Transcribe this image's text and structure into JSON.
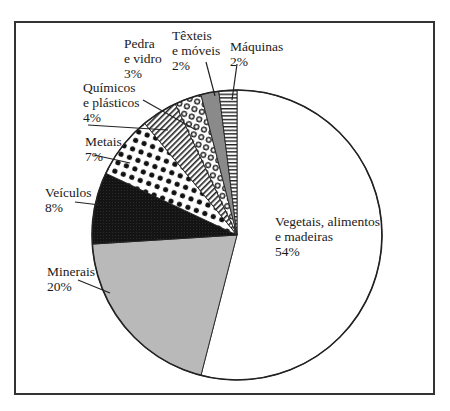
{
  "chart_data": {
    "type": "pie",
    "title": "",
    "start_angle_deg": 0,
    "direction": "clockwise",
    "slices": [
      {
        "label": "Vegetais, alimentos e madeiras",
        "value": 54,
        "pattern": "white"
      },
      {
        "label": "Minerais",
        "value": 20,
        "pattern": "light-gray"
      },
      {
        "label": "Veículos",
        "value": 8,
        "pattern": "black"
      },
      {
        "label": "Metais",
        "value": 7,
        "pattern": "black-dots"
      },
      {
        "label": "Químicos e plásticos",
        "value": 4,
        "pattern": "diagonal-stripes"
      },
      {
        "label": "Pedra e vidro",
        "value": 3,
        "pattern": "rings"
      },
      {
        "label": "Têxteis e móveis",
        "value": 2,
        "pattern": "dark-gray"
      },
      {
        "label": "Máquinas",
        "value": 2,
        "pattern": "horizontal-stripes"
      }
    ]
  },
  "labels": {
    "vegetais": {
      "l1": "Vegetais, alimentos",
      "l2": "e madeiras",
      "pct": "54%"
    },
    "minerais": {
      "l1": "Minerais",
      "pct": "20%"
    },
    "veiculos": {
      "l1": "Veículos",
      "pct": "8%"
    },
    "metais": {
      "l1": "Metais",
      "pct": "7%"
    },
    "quimicos": {
      "l1": "Químicos",
      "l2": "e plásticos",
      "pct": "4%"
    },
    "pedra": {
      "l1": "Pedra",
      "l2": "e vidro",
      "pct": "3%"
    },
    "texteis": {
      "l1": "Têxteis",
      "l2": "e móveis",
      "pct": "2%"
    },
    "maquinas": {
      "l1": "Máquinas",
      "pct": "2%"
    }
  }
}
